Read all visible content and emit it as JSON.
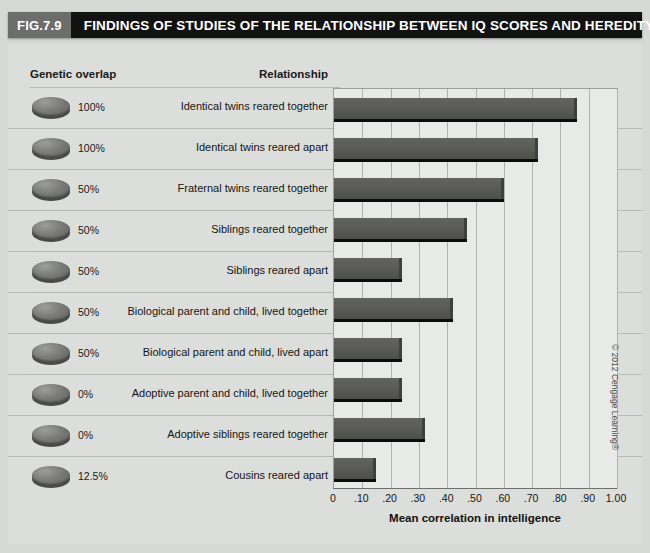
{
  "header": {
    "figure_number": "FIG.7.9",
    "title": "FINDINGS OF STUDIES OF THE RELATIONSHIP BETWEEN IQ SCORES AND HEREDITY"
  },
  "columns": {
    "genetic_overlap": "Genetic overlap",
    "relationship": "Relationship"
  },
  "credit": "© 2012 Cengage Learning®",
  "colors": {
    "bar": "#595a56",
    "bar_shadow": "#0c0c0c",
    "panel_background": "#dcdedb",
    "plot_background": "#e8eae7",
    "header_bar": "#121212",
    "badge": "#6d6e6b",
    "gridline": "#b0b2af"
  },
  "chart_data": {
    "type": "bar",
    "orientation": "horizontal",
    "title": "FINDINGS OF STUDIES OF THE RELATIONSHIP BETWEEN IQ SCORES AND HEREDITY",
    "xlabel": "Mean correlation in intelligence",
    "ylabel": "Relationship",
    "xlim": [
      0,
      1.0
    ],
    "xticks": [
      0,
      0.1,
      0.2,
      0.3,
      0.4,
      0.5,
      0.6,
      0.7,
      0.8,
      0.9,
      1.0
    ],
    "xticklabels": [
      "0",
      ".10",
      ".20",
      ".30",
      ".40",
      ".50",
      ".60",
      ".70",
      ".80",
      ".90",
      "1.00"
    ],
    "grid": true,
    "legend": false,
    "categories": [
      "Identical twins reared together",
      "Identical twins reared apart",
      "Fraternal twins reared together",
      "Siblings reared together",
      "Siblings reared apart",
      "Biological parent and child, lived together",
      "Biological parent and child, lived apart",
      "Adoptive parent and child, lived together",
      "Adoptive siblings reared together",
      "Cousins reared apart"
    ],
    "genetic_overlap": [
      "100%",
      "100%",
      "50%",
      "50%",
      "50%",
      "50%",
      "50%",
      "0%",
      "0%",
      "12.5%"
    ],
    "values": [
      0.86,
      0.72,
      0.6,
      0.47,
      0.24,
      0.42,
      0.24,
      0.24,
      0.32,
      0.15
    ]
  },
  "rows": [
    {
      "overlap": "100%",
      "relationship": "Identical twins reared together",
      "value": 0.86
    },
    {
      "overlap": "100%",
      "relationship": "Identical twins reared apart",
      "value": 0.72
    },
    {
      "overlap": "50%",
      "relationship": "Fraternal twins reared together",
      "value": 0.6
    },
    {
      "overlap": "50%",
      "relationship": "Siblings reared together",
      "value": 0.47
    },
    {
      "overlap": "50%",
      "relationship": "Siblings reared apart",
      "value": 0.24
    },
    {
      "overlap": "50%",
      "relationship": "Biological parent and child, lived together",
      "value": 0.42
    },
    {
      "overlap": "50%",
      "relationship": "Biological parent and child, lived apart",
      "value": 0.24
    },
    {
      "overlap": "0%",
      "relationship": "Adoptive parent and child, lived together",
      "value": 0.24
    },
    {
      "overlap": "0%",
      "relationship": "Adoptive siblings reared together",
      "value": 0.32
    },
    {
      "overlap": "12.5%",
      "relationship": "Cousins reared apart",
      "value": 0.15
    }
  ]
}
